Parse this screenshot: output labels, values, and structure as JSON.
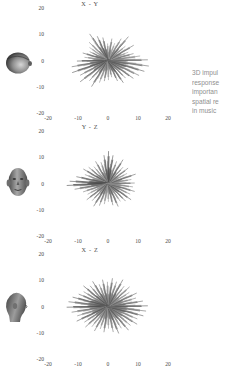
{
  "figure": {
    "background": "#ffffff",
    "ink": "#4a4a4a",
    "caption_color": "#8f8f8f"
  },
  "caption": {
    "lines": [
      "3D impul",
      "response",
      "importan",
      "spatial re",
      "in music "
    ]
  },
  "panels": [
    {
      "title": "X - Y",
      "head_icon": "head-top-view-icon",
      "head_label": "head seen from above"
    },
    {
      "title": "Y - Z",
      "head_icon": "head-front-view-icon",
      "head_label": "head seen from the front"
    },
    {
      "title": "X - Z",
      "head_icon": "head-side-view-icon",
      "head_label": "head seen from the side"
    }
  ],
  "chart_data": {
    "type": "scatter",
    "subtitle": "Radial spike (starburst) plots of reflection arrivals",
    "grid": false,
    "legend": null,
    "xlabel": "",
    "ylabel": "",
    "xlim": [
      -20,
      20
    ],
    "ylim": [
      -20,
      20
    ],
    "xticks": [
      -20,
      -10,
      0,
      10,
      20
    ],
    "yticks": [
      20,
      10,
      0,
      -10,
      -20
    ],
    "xtick_labels": [
      "-20",
      "-10",
      "0",
      "10",
      "20"
    ],
    "ytick_labels": [
      "20",
      "10",
      "0",
      "-10",
      "-20"
    ],
    "panels": [
      {
        "name": "X - Y",
        "plane": "horizontal plane (azimuth)",
        "description": "Dense starburst centered near origin, strongest lobes toward lower-left and right, spikes fan out to roughly +/-14 units",
        "center": [
          0,
          0
        ],
        "spikes": [
          {
            "angle_deg": 0,
            "length": 13.5,
            "shade": "#6a6a6a"
          },
          {
            "angle_deg": 8,
            "length": 11.0,
            "shade": "#888888"
          },
          {
            "angle_deg": 16,
            "length": 9.0,
            "shade": "#777777"
          },
          {
            "angle_deg": 24,
            "length": 7.5,
            "shade": "#9a9a9a"
          },
          {
            "angle_deg": 33,
            "length": 10.5,
            "shade": "#6f6f6f"
          },
          {
            "angle_deg": 42,
            "length": 8.0,
            "shade": "#8b8b8b"
          },
          {
            "angle_deg": 52,
            "length": 11.5,
            "shade": "#656565"
          },
          {
            "angle_deg": 61,
            "length": 9.5,
            "shade": "#7d7d7d"
          },
          {
            "angle_deg": 70,
            "length": 7.0,
            "shade": "#9e9e9e"
          },
          {
            "angle_deg": 80,
            "length": 8.5,
            "shade": "#7a7a7a"
          },
          {
            "angle_deg": 90,
            "length": 6.5,
            "shade": "#909090"
          },
          {
            "angle_deg": 100,
            "length": 9.0,
            "shade": "#6d6d6d"
          },
          {
            "angle_deg": 110,
            "length": 10.0,
            "shade": "#5f5f5f"
          },
          {
            "angle_deg": 120,
            "length": 12.0,
            "shade": "#6b6b6b"
          },
          {
            "angle_deg": 131,
            "length": 9.5,
            "shade": "#848484"
          },
          {
            "angle_deg": 140,
            "length": 8.0,
            "shade": "#9b9b9b"
          },
          {
            "angle_deg": 150,
            "length": 7.0,
            "shade": "#7e7e7e"
          },
          {
            "angle_deg": 160,
            "length": 9.0,
            "shade": "#6c6c6c"
          },
          {
            "angle_deg": 170,
            "length": 8.0,
            "shade": "#8d8d8d"
          },
          {
            "angle_deg": 180,
            "length": 10.5,
            "shade": "#5e5e5e"
          },
          {
            "angle_deg": 190,
            "length": 12.5,
            "shade": "#666666"
          },
          {
            "angle_deg": 200,
            "length": 13.0,
            "shade": "#585858"
          },
          {
            "angle_deg": 210,
            "length": 11.0,
            "shade": "#707070"
          },
          {
            "angle_deg": 220,
            "length": 12.5,
            "shade": "#5c5c5c"
          },
          {
            "angle_deg": 230,
            "length": 10.0,
            "shade": "#7b7b7b"
          },
          {
            "angle_deg": 240,
            "length": 11.5,
            "shade": "#626262"
          },
          {
            "angle_deg": 250,
            "length": 9.0,
            "shade": "#898989"
          },
          {
            "angle_deg": 260,
            "length": 8.0,
            "shade": "#757575"
          },
          {
            "angle_deg": 270,
            "length": 7.5,
            "shade": "#969696"
          },
          {
            "angle_deg": 280,
            "length": 6.5,
            "shade": "#828282"
          },
          {
            "angle_deg": 291,
            "length": 8.5,
            "shade": "#6e6e6e"
          },
          {
            "angle_deg": 300,
            "length": 10.0,
            "shade": "#5a5a5a"
          },
          {
            "angle_deg": 310,
            "length": 9.0,
            "shade": "#787878"
          },
          {
            "angle_deg": 320,
            "length": 11.0,
            "shade": "#636363"
          },
          {
            "angle_deg": 330,
            "length": 12.0,
            "shade": "#717171"
          },
          {
            "angle_deg": 340,
            "length": 13.0,
            "shade": "#5d5d5d"
          },
          {
            "angle_deg": 350,
            "length": 14.0,
            "shade": "#696969"
          }
        ]
      },
      {
        "name": "Y - Z",
        "plane": "frontal plane",
        "description": "Starburst with a prominent dark lobe pointing upward and a long spike extending to the left, spread roughly +/-12 units",
        "center": [
          0,
          0
        ],
        "spikes": [
          {
            "angle_deg": 0,
            "length": 9.0,
            "shade": "#787878"
          },
          {
            "angle_deg": 10,
            "length": 8.0,
            "shade": "#8c8c8c"
          },
          {
            "angle_deg": 20,
            "length": 10.0,
            "shade": "#6a6a6a"
          },
          {
            "angle_deg": 30,
            "length": 7.5,
            "shade": "#959595"
          },
          {
            "angle_deg": 40,
            "length": 9.0,
            "shade": "#737373"
          },
          {
            "angle_deg": 50,
            "length": 8.0,
            "shade": "#868686"
          },
          {
            "angle_deg": 60,
            "length": 10.5,
            "shade": "#606060"
          },
          {
            "angle_deg": 70,
            "length": 9.0,
            "shade": "#7c7c7c"
          },
          {
            "angle_deg": 80,
            "length": 11.0,
            "shade": "#565656"
          },
          {
            "angle_deg": 88,
            "length": 12.5,
            "shade": "#4e4e4e"
          },
          {
            "angle_deg": 96,
            "length": 11.0,
            "shade": "#5a5a5a"
          },
          {
            "angle_deg": 105,
            "length": 8.5,
            "shade": "#818181"
          },
          {
            "angle_deg": 115,
            "length": 9.5,
            "shade": "#6e6e6e"
          },
          {
            "angle_deg": 125,
            "length": 8.0,
            "shade": "#929292"
          },
          {
            "angle_deg": 135,
            "length": 9.0,
            "shade": "#757575"
          },
          {
            "angle_deg": 145,
            "length": 10.0,
            "shade": "#656565"
          },
          {
            "angle_deg": 155,
            "length": 8.5,
            "shade": "#8a8a8a"
          },
          {
            "angle_deg": 165,
            "length": 11.0,
            "shade": "#5f5f5f"
          },
          {
            "angle_deg": 175,
            "length": 13.0,
            "shade": "#545454"
          },
          {
            "angle_deg": 182,
            "length": 14.0,
            "shade": "#4b4b4b"
          },
          {
            "angle_deg": 190,
            "length": 11.5,
            "shade": "#6b6b6b"
          },
          {
            "angle_deg": 200,
            "length": 9.0,
            "shade": "#7f7f7f"
          },
          {
            "angle_deg": 210,
            "length": 8.0,
            "shade": "#949494"
          },
          {
            "angle_deg": 220,
            "length": 9.5,
            "shade": "#6d6d6d"
          },
          {
            "angle_deg": 230,
            "length": 8.5,
            "shade": "#838383"
          },
          {
            "angle_deg": 240,
            "length": 10.0,
            "shade": "#626262"
          },
          {
            "angle_deg": 250,
            "length": 9.0,
            "shade": "#777777"
          },
          {
            "angle_deg": 260,
            "length": 8.0,
            "shade": "#8e8e8e"
          },
          {
            "angle_deg": 270,
            "length": 7.0,
            "shade": "#9a9a9a"
          },
          {
            "angle_deg": 280,
            "length": 8.5,
            "shade": "#747474"
          },
          {
            "angle_deg": 290,
            "length": 9.5,
            "shade": "#686868"
          },
          {
            "angle_deg": 300,
            "length": 8.0,
            "shade": "#8b8b8b"
          },
          {
            "angle_deg": 310,
            "length": 9.0,
            "shade": "#717171"
          },
          {
            "angle_deg": 320,
            "length": 10.0,
            "shade": "#5e5e5e"
          },
          {
            "angle_deg": 330,
            "length": 8.5,
            "shade": "#858585"
          },
          {
            "angle_deg": 340,
            "length": 9.5,
            "shade": "#6f6f6f"
          },
          {
            "angle_deg": 350,
            "length": 8.5,
            "shade": "#898989"
          }
        ]
      },
      {
        "name": "X - Z",
        "plane": "median / sagittal plane",
        "description": "Broad symmetric starburst, widest horizontally, spikes reaching about +/-14 units left and right",
        "center": [
          0,
          0
        ],
        "spikes": [
          {
            "angle_deg": 0,
            "length": 13.5,
            "shade": "#5b5b5b"
          },
          {
            "angle_deg": 9,
            "length": 12.0,
            "shade": "#6c6c6c"
          },
          {
            "angle_deg": 18,
            "length": 10.0,
            "shade": "#828282"
          },
          {
            "angle_deg": 27,
            "length": 11.0,
            "shade": "#6a6a6a"
          },
          {
            "angle_deg": 36,
            "length": 9.0,
            "shade": "#909090"
          },
          {
            "angle_deg": 45,
            "length": 10.5,
            "shade": "#717171"
          },
          {
            "angle_deg": 54,
            "length": 9.5,
            "shade": "#838383"
          },
          {
            "angle_deg": 63,
            "length": 11.5,
            "shade": "#5f5f5f"
          },
          {
            "angle_deg": 72,
            "length": 10.0,
            "shade": "#767676"
          },
          {
            "angle_deg": 81,
            "length": 11.0,
            "shade": "#656565"
          },
          {
            "angle_deg": 90,
            "length": 9.5,
            "shade": "#888888"
          },
          {
            "angle_deg": 99,
            "length": 10.5,
            "shade": "#696969"
          },
          {
            "angle_deg": 108,
            "length": 9.0,
            "shade": "#7e7e7e"
          },
          {
            "angle_deg": 117,
            "length": 11.0,
            "shade": "#616161"
          },
          {
            "angle_deg": 126,
            "length": 10.0,
            "shade": "#737373"
          },
          {
            "angle_deg": 135,
            "length": 11.5,
            "shade": "#595959"
          },
          {
            "angle_deg": 144,
            "length": 10.0,
            "shade": "#7a7a7a"
          },
          {
            "angle_deg": 153,
            "length": 11.0,
            "shade": "#676767"
          },
          {
            "angle_deg": 162,
            "length": 12.5,
            "shade": "#575757"
          },
          {
            "angle_deg": 171,
            "length": 13.5,
            "shade": "#636363"
          },
          {
            "angle_deg": 180,
            "length": 14.0,
            "shade": "#4f4f4f"
          },
          {
            "angle_deg": 189,
            "length": 12.5,
            "shade": "#6e6e6e"
          },
          {
            "angle_deg": 198,
            "length": 11.0,
            "shade": "#808080"
          },
          {
            "angle_deg": 207,
            "length": 12.0,
            "shade": "#5d5d5d"
          },
          {
            "angle_deg": 216,
            "length": 10.0,
            "shade": "#757575"
          },
          {
            "angle_deg": 225,
            "length": 11.0,
            "shade": "#666666"
          },
          {
            "angle_deg": 234,
            "length": 9.5,
            "shade": "#8a8a8a"
          },
          {
            "angle_deg": 243,
            "length": 10.5,
            "shade": "#707070"
          },
          {
            "angle_deg": 252,
            "length": 9.0,
            "shade": "#858585"
          },
          {
            "angle_deg": 261,
            "length": 10.0,
            "shade": "#6b6b6b"
          },
          {
            "angle_deg": 270,
            "length": 8.5,
            "shade": "#929292"
          },
          {
            "angle_deg": 279,
            "length": 10.0,
            "shade": "#747474"
          },
          {
            "angle_deg": 288,
            "length": 11.0,
            "shade": "#626262"
          },
          {
            "angle_deg": 297,
            "length": 9.5,
            "shade": "#878787"
          },
          {
            "angle_deg": 306,
            "length": 11.5,
            "shade": "#5c5c5c"
          },
          {
            "angle_deg": 315,
            "length": 10.5,
            "shade": "#787878"
          },
          {
            "angle_deg": 324,
            "length": 12.0,
            "shade": "#686868"
          },
          {
            "angle_deg": 333,
            "length": 11.0,
            "shade": "#7c7c7c"
          },
          {
            "angle_deg": 342,
            "length": 12.5,
            "shade": "#5a5a5a"
          },
          {
            "angle_deg": 351,
            "length": 13.0,
            "shade": "#6d6d6d"
          }
        ]
      }
    ]
  }
}
